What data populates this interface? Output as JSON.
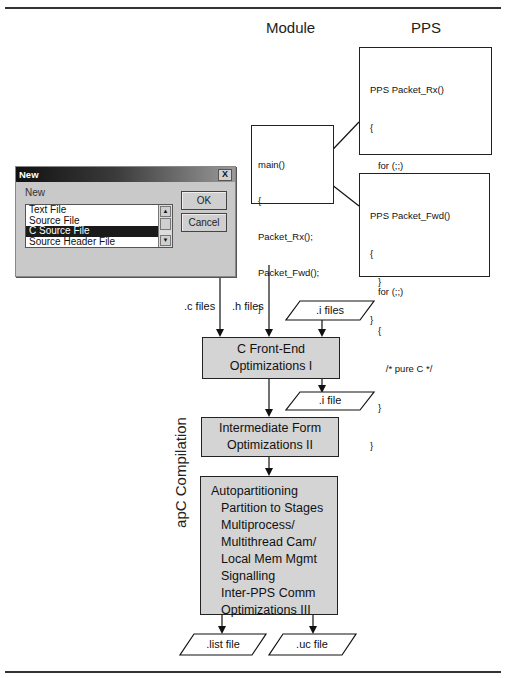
{
  "headers": {
    "module": "Module",
    "pps": "PPS"
  },
  "module_box": {
    "lines": [
      "main()",
      "{",
      "Packet_Rx();",
      "Packet_Fwd();",
      "}"
    ]
  },
  "pps_rx_box": {
    "lines": [
      "PPS Packet_Rx()",
      "{",
      "   for (;;)",
      "   {",
      "      /* C, MSF intrinsics */",
      "   }",
      "}"
    ]
  },
  "pps_fwd_box": {
    "lines": [
      "PPS Packet_Fwd()",
      "{",
      "   for (;;)",
      "   {",
      "      /* pure C */",
      "   }",
      "}"
    ]
  },
  "dialog": {
    "title": "New",
    "close": "X",
    "group_label": "New",
    "items": [
      "Text File",
      "Source File",
      "C Source File",
      "Source Header File"
    ],
    "selected_index": 2,
    "ok_label": "OK",
    "cancel_label": "Cancel"
  },
  "flow": {
    "c_files": ".c files",
    "h_files": ".h files",
    "i_files": ".i files",
    "i_file": ".i file",
    "front_end": [
      "C Front-End",
      "Optimizations I"
    ],
    "intermediate": [
      "Intermediate Form",
      "Optimizations II"
    ],
    "autopartition": {
      "title": "Autopartitioning",
      "items": [
        "Partition to Stages",
        "Multiprocess/",
        "Multithread Cam/",
        "Local Mem Mgmt",
        "Signalling",
        "Inter-PPS Comm",
        "Optimizations III"
      ]
    },
    "list_file": ".list file",
    "uc_file": ".uc file",
    "side_label": "apC Compilation"
  }
}
